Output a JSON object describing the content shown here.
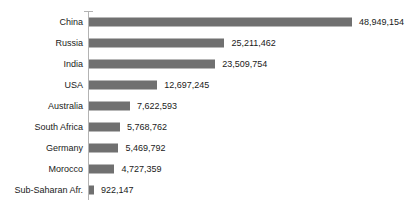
{
  "chart_data": {
    "type": "bar",
    "orientation": "horizontal",
    "title": "",
    "subtitle": "",
    "xlabel": "",
    "ylabel": "",
    "grid": false,
    "legend": null,
    "xlim": [
      0,
      48949154
    ],
    "axis_line": true,
    "bar_color": "#707070",
    "text_color": "#1a1a1a",
    "background_color": "#ffffff",
    "categories": [
      "China",
      "Russia",
      "India",
      "USA",
      "Australia",
      "South Africa",
      "Germany",
      "Morocco",
      "Sub-Saharan Afr."
    ],
    "values": [
      48949154,
      25211462,
      23509754,
      12697245,
      7622593,
      5768762,
      5469792,
      4727359,
      922147
    ],
    "value_labels": [
      "48,949,154",
      "25,211,462",
      "23,509,754",
      "12,697,245",
      "7,622,593",
      "5,768,762",
      "5,469,792",
      "4,727,359",
      "922,147"
    ]
  },
  "clipped_title_remnant": "­ ­ ­ ­"
}
